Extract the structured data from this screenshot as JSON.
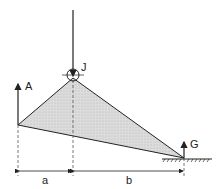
{
  "diagram": {
    "labels": {
      "apex": "J",
      "left_reaction": "A",
      "right_reaction": "G",
      "dim_left": "a",
      "dim_right": "b"
    },
    "colors": {
      "stroke": "#222222",
      "fill": "#d8d8d8",
      "dash": "#555555"
    }
  }
}
